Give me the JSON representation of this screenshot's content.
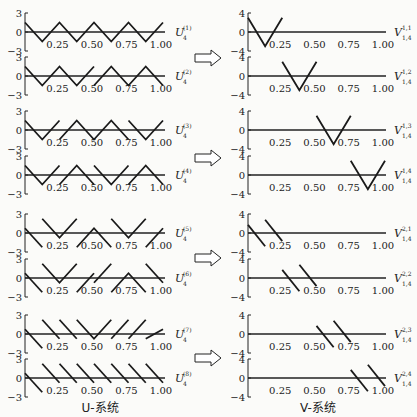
{
  "figure": {
    "left_caption": "U-系统",
    "right_caption": "V-系统",
    "x_ticks": [
      "0.25",
      "0.50",
      "0.75",
      "1.00"
    ],
    "u_y_ticks": [
      "3",
      "0",
      "−3"
    ],
    "v_y_ticks": [
      "4",
      "0",
      "−4"
    ]
  },
  "chart_data": [
    {
      "type": "line",
      "title": "U-系统",
      "xlim": [
        0,
        1
      ],
      "ylim": [
        -3,
        3
      ],
      "x_ticks": [
        0.25,
        0.5,
        0.75,
        1.0
      ],
      "y_ticks": [
        3,
        0,
        -3
      ],
      "series": [
        {
          "name": "U4(1)",
          "label": "U",
          "sub": "4",
          "sup": "(1)",
          "segments": [
            [
              [
                0,
                1.5
              ],
              [
                0.125,
                -1.5
              ],
              [
                0.25,
                1.5
              ],
              [
                0.375,
                -1.5
              ],
              [
                0.5,
                1.5
              ],
              [
                0.625,
                -1.5
              ],
              [
                0.75,
                1.5
              ],
              [
                0.875,
                -1.5
              ],
              [
                1.0,
                1.5
              ]
            ]
          ]
        },
        {
          "name": "U4(2)",
          "label": "U",
          "sub": "4",
          "sup": "(2)",
          "segments": [
            [
              [
                0,
                1.5
              ],
              [
                0.125,
                -1.5
              ],
              [
                0.25,
                1.5
              ],
              [
                0.375,
                -1.5
              ],
              [
                0.5,
                1.5
              ]
            ],
            [
              [
                0.5,
                -1.5
              ],
              [
                0.625,
                1.5
              ],
              [
                0.75,
                -1.5
              ],
              [
                0.875,
                1.5
              ],
              [
                1.0,
                -1.5
              ]
            ]
          ]
        },
        {
          "name": "U4(3)",
          "label": "U",
          "sub": "4",
          "sup": "(3)",
          "segments": [
            [
              [
                0,
                1.5
              ],
              [
                0.125,
                -1.5
              ],
              [
                0.25,
                1.5
              ]
            ],
            [
              [
                0.25,
                -1.5
              ],
              [
                0.375,
                1.5
              ],
              [
                0.5,
                -1.5
              ],
              [
                0.625,
                1.5
              ],
              [
                0.75,
                -1.5
              ]
            ],
            [
              [
                0.75,
                1.5
              ],
              [
                0.875,
                -1.5
              ],
              [
                1.0,
                1.5
              ]
            ]
          ]
        },
        {
          "name": "U4(4)",
          "label": "U",
          "sub": "4",
          "sup": "(4)",
          "segments": [
            [
              [
                0,
                1.5
              ],
              [
                0.125,
                -1.5
              ],
              [
                0.25,
                1.5
              ]
            ],
            [
              [
                0.25,
                -1.5
              ],
              [
                0.375,
                1.5
              ],
              [
                0.5,
                -1.5
              ]
            ],
            [
              [
                0.5,
                1.5
              ],
              [
                0.625,
                -1.5
              ],
              [
                0.75,
                1.5
              ]
            ],
            [
              [
                0.75,
                -1.5
              ],
              [
                0.875,
                1.5
              ],
              [
                1.0,
                -1.5
              ]
            ]
          ]
        },
        {
          "name": "U4(5)",
          "label": "U",
          "sub": "4",
          "sup": "(5)",
          "segments": [
            [
              [
                0,
                0.75
              ],
              [
                0.125,
                -2.25
              ]
            ],
            [
              [
                0.125,
                2.25
              ],
              [
                0.25,
                -0.75
              ],
              [
                0.375,
                2.25
              ]
            ],
            [
              [
                0.375,
                -2.25
              ],
              [
                0.5,
                0.75
              ],
              [
                0.625,
                -2.25
              ]
            ],
            [
              [
                0.625,
                2.25
              ],
              [
                0.75,
                -0.75
              ],
              [
                0.875,
                2.25
              ]
            ],
            [
              [
                0.875,
                -2.25
              ],
              [
                1.0,
                0.75
              ]
            ]
          ]
        },
        {
          "name": "U4(6)",
          "label": "U",
          "sub": "4",
          "sup": "(6)",
          "segments": [
            [
              [
                0,
                0.75
              ],
              [
                0.125,
                -2.25
              ]
            ],
            [
              [
                0.125,
                2.25
              ],
              [
                0.25,
                -0.75
              ],
              [
                0.375,
                2.25
              ]
            ],
            [
              [
                0.375,
                -2.25
              ],
              [
                0.5,
                0.75
              ]
            ],
            [
              [
                0.5,
                -0.75
              ],
              [
                0.625,
                2.25
              ]
            ],
            [
              [
                0.625,
                -2.25
              ],
              [
                0.75,
                0.75
              ],
              [
                0.875,
                -2.25
              ]
            ],
            [
              [
                0.875,
                2.25
              ],
              [
                1.0,
                -0.75
              ]
            ]
          ]
        },
        {
          "name": "U4(7)",
          "label": "U",
          "sub": "4",
          "sup": "(7)",
          "segments": [
            [
              [
                0,
                0.75
              ],
              [
                0.125,
                -2.25
              ]
            ],
            [
              [
                0.125,
                2.25
              ],
              [
                0.25,
                -0.75
              ]
            ],
            [
              [
                0.25,
                2.25
              ],
              [
                0.375,
                -0.75
              ]
            ],
            [
              [
                0.375,
                2.25
              ],
              [
                0.5,
                -0.75
              ],
              [
                0.625,
                2.25
              ]
            ],
            [
              [
                0.625,
                -0.75
              ],
              [
                0.75,
                2.25
              ]
            ],
            [
              [
                0.75,
                -0.75
              ],
              [
                0.875,
                2.25
              ]
            ],
            [
              [
                0.875,
                -0.75
              ],
              [
                1.0,
                0.75
              ]
            ]
          ]
        },
        {
          "name": "U4(8)",
          "label": "U",
          "sub": "4",
          "sup": "(8)",
          "segments": [
            [
              [
                0,
                0.75
              ],
              [
                0.125,
                -2.25
              ]
            ],
            [
              [
                0.125,
                2.25
              ],
              [
                0.25,
                -0.75
              ]
            ],
            [
              [
                0.25,
                2.25
              ],
              [
                0.375,
                -0.75
              ]
            ],
            [
              [
                0.375,
                2.25
              ],
              [
                0.5,
                -0.75
              ]
            ],
            [
              [
                0.5,
                2.25
              ],
              [
                0.625,
                -0.75
              ]
            ],
            [
              [
                0.625,
                2.25
              ],
              [
                0.75,
                -0.75
              ]
            ],
            [
              [
                0.75,
                2.25
              ],
              [
                0.875,
                -0.75
              ]
            ],
            [
              [
                0.875,
                2.25
              ],
              [
                1.0,
                -0.75
              ]
            ]
          ]
        }
      ]
    },
    {
      "type": "line",
      "title": "V-系统",
      "xlim": [
        0,
        1
      ],
      "ylim": [
        -4,
        4
      ],
      "x_ticks": [
        0.25,
        0.5,
        0.75,
        1.0
      ],
      "y_ticks": [
        4,
        0,
        -4
      ],
      "series": [
        {
          "name": "V1,4(1,1)",
          "label": "V",
          "sub": "1,4",
          "sup": "1,1",
          "segments": [
            [
              [
                0,
                3
              ],
              [
                0.125,
                -3
              ],
              [
                0.25,
                3
              ]
            ]
          ]
        },
        {
          "name": "V1,4(1,2)",
          "label": "V",
          "sub": "1,4",
          "sup": "1,2",
          "segments": [
            [
              [
                0.25,
                3
              ],
              [
                0.375,
                -3
              ],
              [
                0.5,
                3
              ]
            ]
          ]
        },
        {
          "name": "V1,4(1,3)",
          "label": "V",
          "sub": "1,4",
          "sup": "1,3",
          "segments": [
            [
              [
                0.5,
                3
              ],
              [
                0.625,
                -3
              ],
              [
                0.75,
                3
              ]
            ]
          ]
        },
        {
          "name": "V1,4(1,4)",
          "label": "V",
          "sub": "1,4",
          "sup": "1,4",
          "segments": [
            [
              [
                0.75,
                3
              ],
              [
                0.875,
                -3
              ],
              [
                1.0,
                3
              ]
            ]
          ]
        },
        {
          "name": "V1,4(2,1)",
          "label": "V",
          "sub": "1,4",
          "sup": "2,1",
          "segments": [
            [
              [
                0,
                1.7
              ],
              [
                0.125,
                -2.8
              ]
            ],
            [
              [
                0.125,
                2.8
              ],
              [
                0.25,
                -1.7
              ]
            ]
          ]
        },
        {
          "name": "V1,4(2,2)",
          "label": "V",
          "sub": "1,4",
          "sup": "2,2",
          "segments": [
            [
              [
                0.25,
                1.7
              ],
              [
                0.375,
                -2.8
              ]
            ],
            [
              [
                0.375,
                2.8
              ],
              [
                0.5,
                -1.7
              ]
            ]
          ]
        },
        {
          "name": "V1,4(2,3)",
          "label": "V",
          "sub": "1,4",
          "sup": "2,3",
          "segments": [
            [
              [
                0.5,
                1.7
              ],
              [
                0.625,
                -2.8
              ]
            ],
            [
              [
                0.625,
                2.8
              ],
              [
                0.75,
                -1.7
              ]
            ]
          ]
        },
        {
          "name": "V1,4(2,4)",
          "label": "V",
          "sub": "1,4",
          "sup": "2,4",
          "segments": [
            [
              [
                0.75,
                1.7
              ],
              [
                0.875,
                -2.8
              ]
            ],
            [
              [
                0.875,
                2.8
              ],
              [
                1.0,
                -1.7
              ]
            ]
          ]
        }
      ]
    }
  ]
}
